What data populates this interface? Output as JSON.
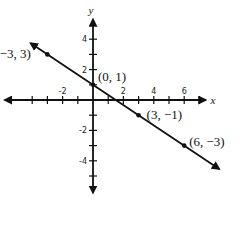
{
  "chart_data": {
    "type": "line",
    "title": "",
    "xlabel": "x",
    "ylabel": "y",
    "xlim": [
      -6,
      7
    ],
    "ylim": [
      -6,
      5
    ],
    "grid": false,
    "x_tick_labels": [
      "-2",
      "2",
      "4",
      "6"
    ],
    "y_tick_labels": [
      "4",
      "2",
      "-2",
      "-4"
    ],
    "series": [
      {
        "name": "line",
        "x": [
          -3,
          0,
          3,
          6
        ],
        "y": [
          3,
          1,
          -1,
          -3
        ],
        "slope": -0.6667,
        "intercept": 1
      }
    ],
    "points": [
      {
        "x": -3,
        "y": 3,
        "label": "(−3, 3)"
      },
      {
        "x": 0,
        "y": 1,
        "label": "(0, 1)"
      },
      {
        "x": 3,
        "y": -1,
        "label": "(3, −1)"
      },
      {
        "x": 6,
        "y": -3,
        "label": "(6, −3)"
      }
    ]
  },
  "colors": {
    "ink": "#111111",
    "background": "#ffffff"
  }
}
